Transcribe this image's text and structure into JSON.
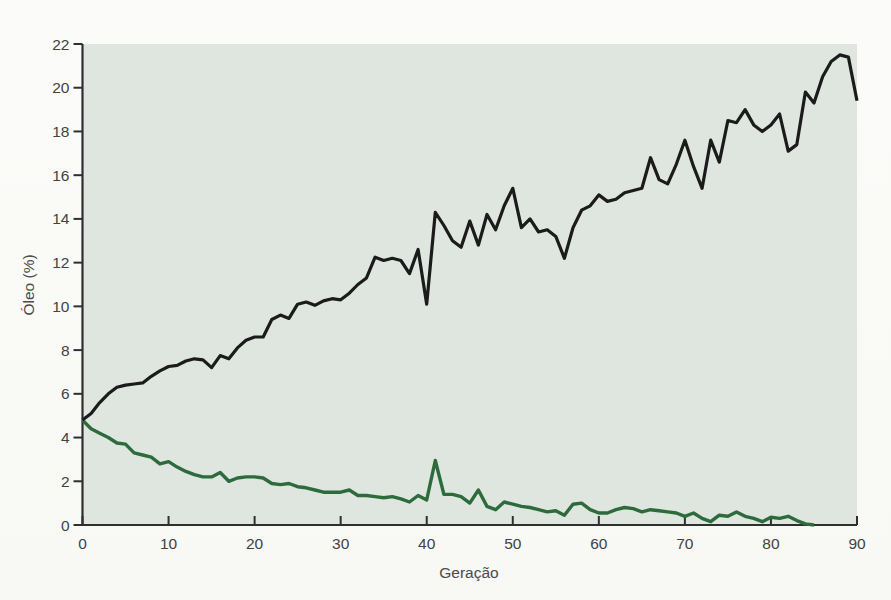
{
  "chart_data": {
    "type": "line",
    "title": "",
    "xlabel": "Geração",
    "ylabel": "Óleo (%)",
    "xlim": [
      0,
      90
    ],
    "ylim": [
      0,
      22
    ],
    "x_ticks": [
      0,
      10,
      20,
      30,
      40,
      50,
      60,
      70,
      80,
      90
    ],
    "y_ticks": [
      0,
      2,
      4,
      6,
      8,
      10,
      12,
      14,
      16,
      18,
      20,
      22
    ],
    "grid": false,
    "legend": null,
    "plot_background": "#dfe6e0",
    "axis_color": "#2f2f2f",
    "tick_label_color": "#424242",
    "series": [
      {
        "id": "black-line",
        "color": "#1b1b1b",
        "stroke_width": 3.2,
        "x_start": 0,
        "x_step": 1,
        "values": [
          4.8,
          5.1,
          5.6,
          6.0,
          6.3,
          6.4,
          6.45,
          6.5,
          6.8,
          7.05,
          7.25,
          7.3,
          7.5,
          7.6,
          7.55,
          7.2,
          7.75,
          7.6,
          8.1,
          8.45,
          8.6,
          8.6,
          9.4,
          9.6,
          9.45,
          10.1,
          10.2,
          10.05,
          10.25,
          10.35,
          10.3,
          10.6,
          11.0,
          11.3,
          12.25,
          12.1,
          12.2,
          12.1,
          11.5,
          12.6,
          10.1,
          14.3,
          13.7,
          13.0,
          12.7,
          13.9,
          12.8,
          14.2,
          13.5,
          14.6,
          15.4,
          13.6,
          14.0,
          13.4,
          13.5,
          13.2,
          12.2,
          13.6,
          14.4,
          14.6,
          15.1,
          14.8,
          14.9,
          15.2,
          15.3,
          15.4,
          16.8,
          15.8,
          15.6,
          16.5,
          17.6,
          16.4,
          15.4,
          17.6,
          16.6,
          18.5,
          18.4,
          19.0,
          18.3,
          18.0,
          18.3,
          18.8,
          17.1,
          17.4,
          19.8,
          19.3,
          20.5,
          21.2,
          21.5,
          21.4,
          19.4
        ]
      },
      {
        "id": "green-line",
        "color": "#2e6b3c",
        "stroke_width": 3.4,
        "x_start": 0,
        "x_step": 1,
        "values": [
          4.8,
          4.4,
          4.2,
          4.0,
          3.75,
          3.7,
          3.3,
          3.2,
          3.1,
          2.8,
          2.9,
          2.65,
          2.45,
          2.3,
          2.2,
          2.2,
          2.4,
          2.0,
          2.15,
          2.2,
          2.2,
          2.15,
          1.9,
          1.85,
          1.9,
          1.75,
          1.7,
          1.6,
          1.5,
          1.5,
          1.5,
          1.6,
          1.35,
          1.35,
          1.3,
          1.25,
          1.3,
          1.2,
          1.05,
          1.35,
          1.15,
          2.95,
          1.4,
          1.4,
          1.3,
          1.0,
          1.6,
          0.85,
          0.7,
          1.05,
          0.95,
          0.85,
          0.8,
          0.7,
          0.6,
          0.65,
          0.45,
          0.95,
          1.0,
          0.7,
          0.55,
          0.55,
          0.7,
          0.8,
          0.75,
          0.6,
          0.7,
          0.65,
          0.6,
          0.55,
          0.4,
          0.55,
          0.3,
          0.15,
          0.45,
          0.4,
          0.6,
          0.4,
          0.3,
          0.15,
          0.35,
          0.3,
          0.4,
          0.2,
          0.05,
          0.0
        ]
      }
    ]
  },
  "colors": {
    "page_background": "#fbfbf9"
  }
}
